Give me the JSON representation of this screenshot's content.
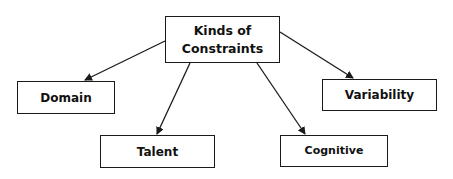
{
  "diagram": {
    "type": "hierarchy",
    "root": {
      "id": "root",
      "label_line1": "Kinds of",
      "label_line2": "Constraints"
    },
    "children": [
      {
        "id": "domain",
        "label": "Domain"
      },
      {
        "id": "talent",
        "label": "Talent"
      },
      {
        "id": "cognitive",
        "label": "Cognitive"
      },
      {
        "id": "variability",
        "label": "Variability"
      }
    ],
    "edges": [
      {
        "from": "root",
        "to": "domain"
      },
      {
        "from": "root",
        "to": "talent"
      },
      {
        "from": "root",
        "to": "cognitive"
      },
      {
        "from": "root",
        "to": "variability"
      }
    ],
    "colors": {
      "line": "#1a1a1a",
      "text": "#111111",
      "background": "#ffffff"
    }
  }
}
